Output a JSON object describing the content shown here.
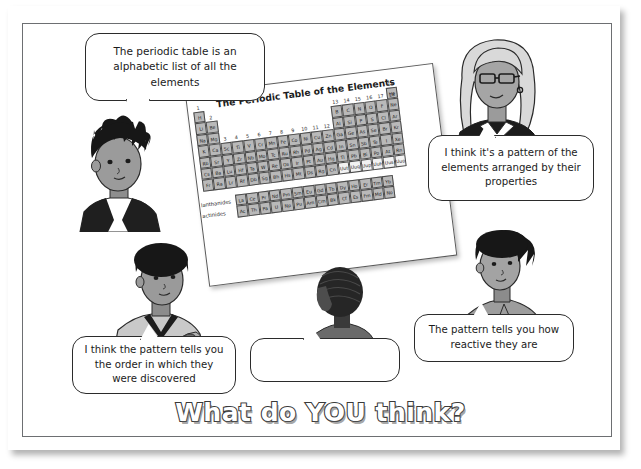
{
  "page": {
    "headline": "What do YOU think?",
    "frame_color": "#6d6f72",
    "bubble_border_color": "#2b2b2b"
  },
  "speech_bubbles": [
    {
      "id": "alphabetic",
      "speaker": "spiky-haired-student-left",
      "text": "The periodic table is an alphabetic list of all the elements",
      "empty": false
    },
    {
      "id": "properties",
      "speaker": "girl-with-glasses-top-right",
      "text": "I think it's a pattern of the elements arranged by their properties",
      "empty": false
    },
    {
      "id": "discovered",
      "speaker": "afro-student-bottom-left",
      "text": "I think the pattern tells you the order in which they were discovered",
      "empty": false
    },
    {
      "id": "reactive",
      "speaker": "spiky-haired-student-right",
      "text": "The pattern tells you how reactive they are",
      "empty": false
    },
    {
      "id": "blank",
      "speaker": "student-centre",
      "text": "",
      "empty": true
    }
  ],
  "people": [
    {
      "id": "spiky-haired-student-left",
      "description": "student with spiky black hair wearing a waistcoat"
    },
    {
      "id": "girl-with-glasses-top-right",
      "description": "girl with glasses, long hair and earrings"
    },
    {
      "id": "afro-student-bottom-left",
      "description": "student with afro hair in a v-neck top"
    },
    {
      "id": "student-centre",
      "description": "student seen from behind with braided hair"
    },
    {
      "id": "spiky-haired-student-right",
      "description": "student with messy spiky hair"
    }
  ],
  "periodic_table": {
    "title": "The Periodic Table of the Elements",
    "group_numbers_left": [
      "1",
      "2"
    ],
    "group_numbers_middle": [
      "3",
      "4",
      "5",
      "6",
      "7",
      "8",
      "9",
      "10",
      "11",
      "12"
    ],
    "group_numbers_right": [
      "13",
      "14",
      "15",
      "16",
      "17",
      "18"
    ],
    "series_labels": [
      "lanthanides",
      "actinides"
    ],
    "rows": {
      "period1": [
        "H",
        "He"
      ],
      "period2": [
        "Li",
        "Be",
        "B",
        "C",
        "N",
        "O",
        "F",
        "Ne"
      ],
      "period3": [
        "Na",
        "Mg",
        "Al",
        "Si",
        "P",
        "S",
        "Cl",
        "Ar"
      ],
      "period4": [
        "K",
        "Ca",
        "Sc",
        "Ti",
        "V",
        "Cr",
        "Mn",
        "Fe",
        "Co",
        "Ni",
        "Cu",
        "Zn",
        "Ga",
        "Ge",
        "As",
        "Se",
        "Br",
        "Kr"
      ],
      "period5": [
        "Rb",
        "Sr",
        "Y",
        "Zr",
        "Nb",
        "Mo",
        "Tc",
        "Ru",
        "Rh",
        "Pd",
        "Ag",
        "Cd",
        "In",
        "Sn",
        "Sb",
        "Te",
        "I",
        "Xe"
      ],
      "period6": [
        "Cs",
        "Ba",
        "Lu",
        "Hf",
        "Ta",
        "W",
        "Re",
        "Os",
        "Ir",
        "Pt",
        "Au",
        "Hg",
        "Tl",
        "Pb",
        "Bi",
        "Po",
        "At",
        "Rn"
      ],
      "period7": [
        "Fr",
        "Ra",
        "Lr",
        "Rf",
        "Db",
        "Sg",
        "Bh",
        "Hs",
        "Mt",
        "Ds",
        "Rg",
        "Cn",
        "Uut",
        "Uuq",
        "Uup",
        "Uuh",
        "Uus",
        "Uuo"
      ],
      "lanthanides": [
        "La",
        "Ce",
        "Pr",
        "Nd",
        "Pm",
        "Sm",
        "Eu",
        "Gd",
        "Tb",
        "Dy",
        "Ho",
        "Er",
        "Tm",
        "Yb"
      ],
      "actinides": [
        "Ac",
        "Th",
        "Pa",
        "U",
        "Np",
        "Pu",
        "Am",
        "Cm",
        "Bk",
        "Cf",
        "Es",
        "Fm",
        "Md",
        "No"
      ]
    },
    "cell_fill": "#b9b9b9",
    "pale_cells": [
      "Uut",
      "Uuq",
      "Uup",
      "Uuh",
      "Uus",
      "Uuo"
    ]
  }
}
